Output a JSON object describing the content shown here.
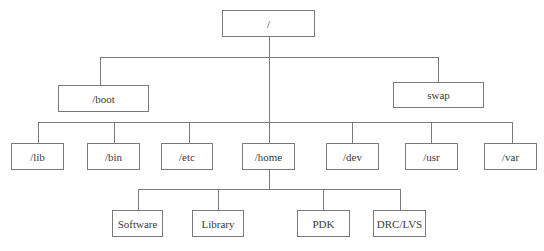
{
  "diagram": {
    "type": "tree",
    "title": "",
    "line_color": "#7a7a7a",
    "nodes": {
      "root": {
        "label": "/"
      },
      "boot": {
        "label": "/boot"
      },
      "swap": {
        "label": "swap"
      },
      "lib": {
        "label": "/lib"
      },
      "bin": {
        "label": "/bin"
      },
      "etc": {
        "label": "/etc"
      },
      "home": {
        "label": "/home"
      },
      "dev": {
        "label": "/dev"
      },
      "usr": {
        "label": "/usr"
      },
      "var": {
        "label": "/var"
      },
      "software": {
        "label": "Software"
      },
      "library": {
        "label": "Library"
      },
      "pdk": {
        "label": "PDK"
      },
      "drclvs": {
        "label": "DRC/LVS"
      }
    },
    "edges": [
      [
        "root",
        "boot"
      ],
      [
        "root",
        "swap"
      ],
      [
        "root",
        "lib"
      ],
      [
        "root",
        "bin"
      ],
      [
        "root",
        "etc"
      ],
      [
        "root",
        "home"
      ],
      [
        "root",
        "dev"
      ],
      [
        "root",
        "usr"
      ],
      [
        "root",
        "var"
      ],
      [
        "home",
        "software"
      ],
      [
        "home",
        "library"
      ],
      [
        "home",
        "pdk"
      ],
      [
        "home",
        "drclvs"
      ]
    ]
  }
}
